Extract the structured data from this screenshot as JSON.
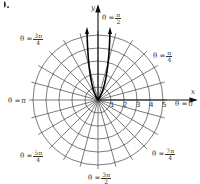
{
  "figure": {
    "problem_number": "9.",
    "axes": {
      "x_label": "x",
      "y_label": "y"
    },
    "grid": {
      "type": "polar",
      "radii": [
        1,
        2,
        3,
        4,
        5
      ],
      "angular_step_deg": 15,
      "radial_tick_labels": [
        "1",
        "2",
        "3",
        "4",
        "5"
      ]
    },
    "angle_labels": [
      {
        "id": "theta-0",
        "prefix": "θ = ",
        "value": "0"
      },
      {
        "id": "theta-pi-4",
        "prefix": "θ = ",
        "num": "π",
        "den": "4"
      },
      {
        "id": "theta-pi-2",
        "prefix": "θ = ",
        "num": "π",
        "den": "2"
      },
      {
        "id": "theta-3pi-4",
        "prefix": "θ = ",
        "num": "3π",
        "den": "4"
      },
      {
        "id": "theta-pi",
        "prefix": "θ = ",
        "value": "π"
      },
      {
        "id": "theta-5pi-4",
        "prefix": "θ = ",
        "num": "5π",
        "den": "4"
      },
      {
        "id": "theta-3pi-2",
        "prefix": "θ = ",
        "num": "3π",
        "den": "2"
      },
      {
        "id": "theta-7pi-4",
        "prefix": "θ = ",
        "num": "7π",
        "den": "4"
      }
    ],
    "curve": {
      "description": "thick curve with two near-vertical branches from origin toward θ = π/2, arrowheads at top"
    }
  }
}
